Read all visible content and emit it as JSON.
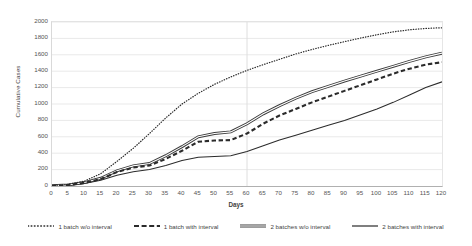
{
  "chart_data": {
    "type": "line",
    "title": "",
    "xlabel": "Days",
    "ylabel": "Cumulative Cases",
    "xlim": [
      0,
      120
    ],
    "ylim": [
      0,
      2000
    ],
    "grid": true,
    "legend_position": "bottom",
    "x_ticks": [
      0,
      5,
      10,
      15,
      20,
      25,
      30,
      35,
      40,
      45,
      50,
      55,
      60,
      65,
      70,
      75,
      80,
      85,
      90,
      95,
      100,
      105,
      110,
      115,
      120
    ],
    "y_ticks": [
      0,
      200,
      400,
      600,
      800,
      1000,
      1200,
      1400,
      1600,
      1800,
      2000
    ],
    "x": [
      0,
      5,
      10,
      15,
      20,
      25,
      30,
      35,
      40,
      45,
      50,
      55,
      60,
      65,
      70,
      75,
      80,
      85,
      90,
      95,
      100,
      105,
      110,
      115,
      120
    ],
    "series": [
      {
        "name": "1 batch w/o interval",
        "style": "dotted",
        "color": "#2b2b2b",
        "values": [
          5,
          20,
          60,
          150,
          300,
          460,
          640,
          830,
          1000,
          1130,
          1240,
          1330,
          1410,
          1480,
          1545,
          1610,
          1665,
          1715,
          1760,
          1805,
          1845,
          1880,
          1905,
          1922,
          1930
        ]
      },
      {
        "name": "1 batch with interval",
        "style": "dashed",
        "color": "#2b2b2b",
        "values": [
          3,
          12,
          38,
          85,
          170,
          225,
          250,
          330,
          430,
          540,
          555,
          560,
          640,
          760,
          860,
          940,
          1020,
          1090,
          1160,
          1230,
          1300,
          1370,
          1430,
          1480,
          1510
        ]
      },
      {
        "name": "2 batches w/o interval",
        "style": "double",
        "color": "#3a3a3a",
        "values": [
          3,
          14,
          42,
          95,
          185,
          245,
          275,
          370,
          480,
          600,
          640,
          660,
          760,
          880,
          980,
          1070,
          1150,
          1215,
          1280,
          1340,
          1400,
          1460,
          1520,
          1575,
          1620
        ]
      },
      {
        "name": "2 batches with interval",
        "style": "solid",
        "color": "#2b2b2b",
        "values": [
          2,
          9,
          30,
          70,
          130,
          175,
          200,
          250,
          310,
          350,
          360,
          370,
          420,
          490,
          560,
          620,
          680,
          740,
          800,
          870,
          940,
          1020,
          1110,
          1200,
          1270
        ]
      }
    ]
  },
  "legend": {
    "items": [
      {
        "label": "1 batch w/o interval"
      },
      {
        "label": "1 batch with interval"
      },
      {
        "label": "2 batches w/o interval"
      },
      {
        "label": "2 batches with interval"
      }
    ]
  }
}
